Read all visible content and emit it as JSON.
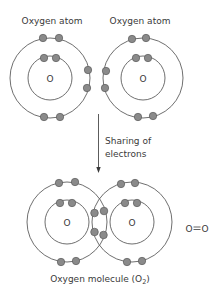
{
  "diagram": {
    "top": {
      "left_atom": {
        "label": "Oxygen atom",
        "nucleus": "O"
      },
      "right_atom": {
        "label": "Oxygen atom",
        "nucleus": "O"
      }
    },
    "arrow": {
      "label_line1": "Sharing of",
      "label_line2": "electrons"
    },
    "bottom": {
      "left_nucleus": "O",
      "right_nucleus": "O",
      "caption": "Oxygen molecule (O",
      "caption_subscript": "2",
      "caption_end": ")",
      "formula_left": "O",
      "formula_bond": "=",
      "formula_right": "O"
    },
    "colors": {
      "electron_fill": "#8a8a8a",
      "orbit_stroke": "#4a4a4a",
      "text": "#3a3a3a"
    }
  }
}
